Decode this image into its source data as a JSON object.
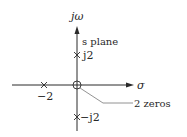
{
  "diagram": {
    "type": "pole-zero plot",
    "plane_label": "s plane",
    "axes": {
      "vertical_label": "jω",
      "horizontal_label": "σ"
    },
    "poles": [
      {
        "id": "pole-neg2",
        "real": -2,
        "imag": 0,
        "label": "−2"
      },
      {
        "id": "pole-j2",
        "real": 0,
        "imag": 2,
        "label": "j2"
      },
      {
        "id": "pole-negj2",
        "real": 0,
        "imag": -2,
        "label": "−j2"
      }
    ],
    "zeros": [
      {
        "id": "zero-origin",
        "real": 0,
        "imag": 0,
        "multiplicity": 2,
        "annotation": "2 zeros"
      }
    ],
    "colors": {
      "ink": "#2a2a2a",
      "leader": "#777777"
    }
  }
}
